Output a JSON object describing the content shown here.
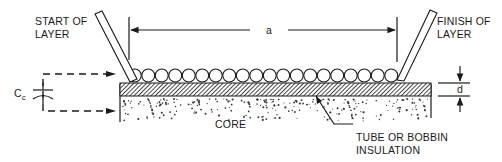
{
  "labels": {
    "start_line1": "START OF",
    "start_line2": "LAYER",
    "finish_line1": "FINISH OF",
    "finish_line2": "LAYER",
    "dimension_a": "a",
    "dimension_d": "d",
    "capacitance_symbol": "C",
    "capacitance_subscript": "c",
    "core": "CORE",
    "insulation_line1": "TUBE OR BOBBIN",
    "insulation_line2": "INSULATION"
  },
  "winding": {
    "turn_count": 20
  },
  "colors": {
    "ink": "#1a1a1a",
    "background": "#ffffff"
  }
}
